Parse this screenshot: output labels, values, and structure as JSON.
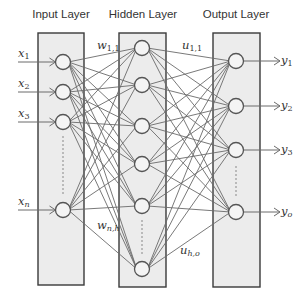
{
  "colors": {
    "box_fill": "#ececec",
    "box_stroke": "#3a3a3a",
    "edge": "#6a6a6a",
    "node_fill": "#f4f4f4",
    "node_stroke": "#555555",
    "dots": "#888888",
    "text": "#333333"
  },
  "layers": [
    {
      "name": "input",
      "title": "Input Layer",
      "box": {
        "x": 38,
        "y": 33,
        "w": 46,
        "h": 252
      },
      "title_pos": {
        "x": 61,
        "y": 8
      },
      "nodes": [
        {
          "cx": 63,
          "cy": 62
        },
        {
          "cx": 63,
          "cy": 92
        },
        {
          "cx": 63,
          "cy": 122
        },
        {
          "cx": 63,
          "cy": 210
        }
      ],
      "ellipsis": {
        "x": 63,
        "y1": 136,
        "y2": 194
      }
    },
    {
      "name": "hidden",
      "title": "Hidden Layer",
      "box": {
        "x": 119,
        "y": 33,
        "w": 47,
        "h": 254
      },
      "title_pos": {
        "x": 143,
        "y": 8
      },
      "nodes": [
        {
          "cx": 142,
          "cy": 48
        },
        {
          "cx": 142,
          "cy": 85
        },
        {
          "cx": 142,
          "cy": 126
        },
        {
          "cx": 142,
          "cy": 164
        },
        {
          "cx": 142,
          "cy": 206
        },
        {
          "cx": 142,
          "cy": 269
        }
      ],
      "ellipsis": {
        "x": 142,
        "y1": 220,
        "y2": 254
      }
    },
    {
      "name": "output",
      "title": "Output Layer",
      "box": {
        "x": 213,
        "y": 33,
        "w": 47,
        "h": 254
      },
      "title_pos": {
        "x": 236,
        "y": 8
      },
      "nodes": [
        {
          "cx": 236,
          "cy": 61
        },
        {
          "cx": 236,
          "cy": 106
        },
        {
          "cx": 236,
          "cy": 150
        },
        {
          "cx": 236,
          "cy": 212
        }
      ],
      "ellipsis": {
        "x": 236,
        "y1": 166,
        "y2": 196
      }
    }
  ],
  "node_radius": 7.5,
  "inputs": [
    {
      "base": "x",
      "sub": "1",
      "label_x": 18,
      "label_y": 48
    },
    {
      "base": "x",
      "sub": "2",
      "label_x": 18,
      "label_y": 78
    },
    {
      "base": "x",
      "sub": "3",
      "label_x": 18,
      "label_y": 108
    },
    {
      "base": "x",
      "sub": "n",
      "label_x": 18,
      "label_y": 196
    }
  ],
  "outputs": [
    {
      "base": "y",
      "sub": "1",
      "label_x": 281,
      "label_y": 55
    },
    {
      "base": "y",
      "sub": "2",
      "label_x": 281,
      "label_y": 100
    },
    {
      "base": "y",
      "sub": "3",
      "label_x": 281,
      "label_y": 144
    },
    {
      "base": "y",
      "sub": "o",
      "label_x": 281,
      "label_y": 206
    }
  ],
  "weight_labels": [
    {
      "base": "w",
      "sub": "1,1",
      "x": 97,
      "y": 40
    },
    {
      "base": "u",
      "sub": "1,1",
      "x": 182,
      "y": 40
    },
    {
      "base": "w",
      "sub": "n,h",
      "x": 97,
      "y": 220
    },
    {
      "base": "u",
      "sub": "h,o",
      "x": 180,
      "y": 245
    }
  ],
  "input_arrow": {
    "x_start": 18,
    "x_end": 55
  },
  "output_arrow": {
    "x_start": 244,
    "x_end": 280
  }
}
